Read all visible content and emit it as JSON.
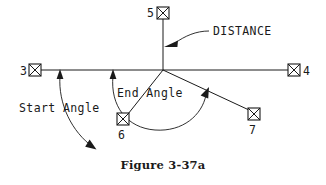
{
  "figure": {
    "caption": "Figure 3-37a",
    "background_color": "#ffffff",
    "ink_color": "#1a1a1a"
  },
  "diagram": {
    "type": "engineering-arc-definition-diagram",
    "center": {
      "x": 163,
      "y": 70
    },
    "points": [
      {
        "id": "3",
        "label": "3",
        "x": 35,
        "y": 70,
        "label_x": 22,
        "label_y": 74,
        "label_side": "left"
      },
      {
        "id": "4",
        "label": "4",
        "x": 295,
        "y": 70,
        "label_x": 304,
        "label_y": 74,
        "label_side": "right"
      },
      {
        "id": "5",
        "label": "5",
        "x": 163,
        "y": 12,
        "label_x": 150,
        "label_y": 16,
        "label_side": "left"
      },
      {
        "id": "6",
        "label": "6",
        "x": 123,
        "y": 119,
        "label_x": 119,
        "label_y": 136,
        "label_side": "below"
      },
      {
        "id": "7",
        "label": "7",
        "x": 254,
        "y": 114,
        "label_x": 250,
        "label_y": 131,
        "label_side": "below"
      }
    ],
    "annotations": [
      {
        "id": "distance",
        "label": "DISTANCE",
        "x": 213,
        "y": 32,
        "anchor": "start"
      },
      {
        "id": "start-angle",
        "label": "Start Angle",
        "x": 22,
        "y": 108,
        "anchor": "start"
      },
      {
        "id": "end-angle",
        "label": "End Angle",
        "x": 118,
        "y": 93,
        "anchor": "start"
      }
    ],
    "lines": [
      {
        "id": "horizontal-axis",
        "from": "3",
        "to": "4"
      },
      {
        "id": "vertical-axis",
        "from": "5",
        "to": "center"
      },
      {
        "id": "center-to-6",
        "from": "center",
        "to": "6"
      },
      {
        "id": "center-to-7",
        "from": "center",
        "to": "7"
      }
    ],
    "arcs": [
      {
        "id": "start-angle-arc",
        "note": "arc from horizontal line down to ray toward point 6, arrowheads both ends"
      },
      {
        "id": "end-angle-arc",
        "note": "arc from horizontal line around to ray toward point 7, arrowheads both ends"
      }
    ],
    "leaders": [
      {
        "id": "distance-leader",
        "note": "curved leader from DISTANCE text to arrowhead on vertical axis"
      }
    ]
  }
}
